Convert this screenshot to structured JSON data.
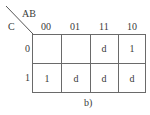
{
  "kmap": {
    "row_var": "C",
    "col_var": "AB",
    "col_headers": [
      "00",
      "01",
      "11",
      "10"
    ],
    "row_headers": [
      "0",
      "1"
    ],
    "rows": [
      [
        "",
        "",
        "d",
        "1"
      ],
      [
        "1",
        "d",
        "d",
        "d"
      ]
    ],
    "caption": "b)"
  }
}
